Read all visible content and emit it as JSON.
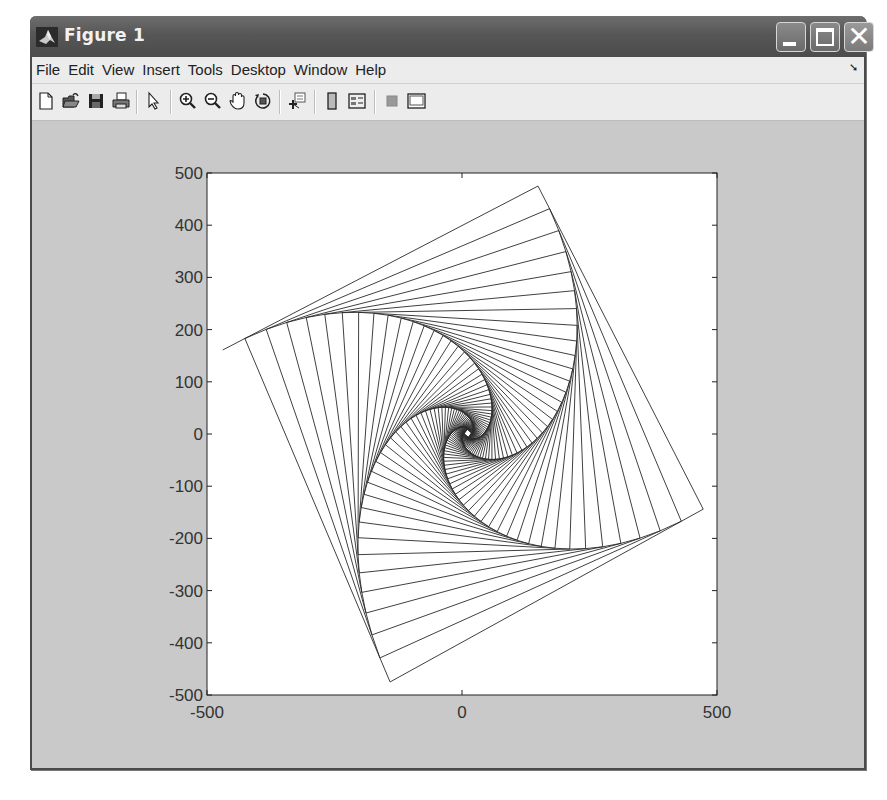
{
  "window": {
    "title": "Figure 1",
    "icon": "matlab-logo-icon",
    "controls": {
      "minimize": "minimize-icon",
      "maximize": "maximize-icon",
      "close": "close-icon"
    }
  },
  "menubar": {
    "items": [
      "File",
      "Edit",
      "View",
      "Insert",
      "Tools",
      "Desktop",
      "Window",
      "Help"
    ],
    "dock_icon": "dock-arrow-icon"
  },
  "toolbar": {
    "buttons": [
      {
        "name": "new-figure",
        "icon": "new-document-icon"
      },
      {
        "name": "open-file",
        "icon": "open-folder-icon"
      },
      {
        "name": "save-figure",
        "icon": "save-disk-icon"
      },
      {
        "name": "print-figure",
        "icon": "printer-icon"
      },
      {
        "name": "edit-plot",
        "icon": "pointer-arrow-icon"
      },
      {
        "name": "zoom-in",
        "icon": "zoom-in-icon"
      },
      {
        "name": "zoom-out",
        "icon": "zoom-out-icon"
      },
      {
        "name": "pan",
        "icon": "hand-icon"
      },
      {
        "name": "rotate-3d",
        "icon": "rotate-3d-icon"
      },
      {
        "name": "data-cursor",
        "icon": "data-cursor-icon"
      },
      {
        "name": "insert-colorbar",
        "icon": "colorbar-icon"
      },
      {
        "name": "insert-legend",
        "icon": "legend-icon"
      },
      {
        "name": "hide-plot-tools",
        "icon": "hide-plot-tools-icon"
      },
      {
        "name": "show-plot-tools",
        "icon": "show-plot-tools-icon"
      }
    ]
  },
  "colors": {
    "figure_background": "#c9c9c9",
    "axes_background": "#ffffff",
    "line_color": "#2a2a2a"
  },
  "chart_data": {
    "type": "line",
    "title": "",
    "xlabel": "",
    "ylabel": "",
    "xlim": [
      -500,
      500
    ],
    "ylim": [
      -500,
      500
    ],
    "xticks": [
      -500,
      0,
      500
    ],
    "xtick_labels": [
      "-500",
      "0",
      "500"
    ],
    "yticks": [
      500,
      400,
      300,
      200,
      100,
      0,
      -100,
      -200,
      -300,
      -400,
      -500
    ],
    "ytick_labels": [
      "500",
      "400",
      "300",
      "200",
      "100",
      "0",
      "-100",
      "-200",
      "-300",
      "-400",
      "-500"
    ],
    "grid": false,
    "legend": null,
    "series": [
      {
        "name": "whirl",
        "initial_square": [
          [
            -469,
            161
          ],
          [
            149,
            475
          ],
          [
            473,
            -144
          ],
          [
            -141,
            -475
          ]
        ],
        "fraction_along_side": 0.07,
        "num_squares": 60
      }
    ]
  }
}
